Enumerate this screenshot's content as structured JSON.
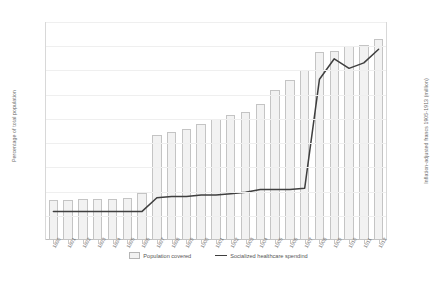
{
  "chart_data": {
    "type": "bar",
    "title": "",
    "xlabel": "",
    "ylabel": "Percentage of total population",
    "ylabel_secondary": "Inflation-adjusted francs 1905-1913 (million)",
    "grid": false,
    "legend_position": "bottom",
    "categories": [
      "1890",
      "1891",
      "1892",
      "1893",
      "1894",
      "1895",
      "1896",
      "1897",
      "1898",
      "1899",
      "1900",
      "1901",
      "1902",
      "1903",
      "1904",
      "1905",
      "1906",
      "1907",
      "1908",
      "1909",
      "1910",
      "1911",
      "1912"
    ],
    "yticks_left": [
      "0%",
      "2%",
      "4%",
      "6%",
      "8%",
      "10%",
      "12%",
      "14%",
      "16%",
      "18%"
    ],
    "yticks_right": [
      "0",
      "20",
      "40",
      "60",
      "80",
      "100",
      "120",
      "140",
      "160"
    ],
    "ylim_left": [
      0,
      18
    ],
    "ylim_right": [
      0,
      160
    ],
    "series": [
      {
        "name": "Population covered",
        "type": "bar",
        "axis": "left",
        "unit": "%",
        "values": [
          3.3,
          3.3,
          3.4,
          3.4,
          3.4,
          3.5,
          3.9,
          8.7,
          8.9,
          9.2,
          9.6,
          10.0,
          10.3,
          10.6,
          11.2,
          12.4,
          13.2,
          14.0,
          15.5,
          15.6,
          16.0,
          16.1,
          16.6
        ]
      },
      {
        "name": "Socialized healthcare spendind",
        "type": "line",
        "axis": "right",
        "unit": "million francs",
        "values": [
          21,
          21,
          21,
          21,
          21,
          21,
          21,
          31,
          32,
          32,
          33,
          33,
          34,
          35,
          37,
          37,
          37,
          38,
          118,
          133,
          126,
          130,
          140
        ]
      }
    ],
    "legend": [
      {
        "label": "Population covered",
        "marker": "bar-swatch"
      },
      {
        "label": "Socialized healthcare spendind",
        "marker": "line"
      }
    ],
    "colors": {
      "bar_fill": "#f2f2f2",
      "bar_border": "#c4c4c4",
      "line": "#3f3f3f",
      "axis": "#c9c9c9",
      "text": "#6f6f6f"
    }
  }
}
